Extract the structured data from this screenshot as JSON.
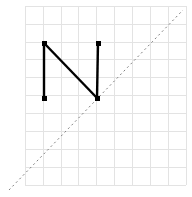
{
  "figure": {
    "width": 192,
    "height": 197,
    "background_color": "#ffffff",
    "title": ""
  },
  "grid": {
    "color": "#e3e3e3",
    "line_width": 1,
    "visible": true,
    "spacing_px": 17.9,
    "x_lines": [
      25.2,
      43.1,
      61.0,
      78.9,
      96.8,
      114.7,
      132.6,
      150.5,
      168.4,
      186.3
    ],
    "y_lines": [
      6.2,
      24.1,
      42.0,
      59.9,
      77.8,
      95.7,
      113.6,
      131.5,
      149.4,
      167.3,
      185.2
    ],
    "x_min": 25.2,
    "x_max": 186.3,
    "y_min": 6.2,
    "y_max": 185.2
  },
  "identity_line": {
    "name": "diagonal-dashed-line",
    "color": "#808080",
    "line_width": 1,
    "dash_pattern": "2,3",
    "x1": 9.0,
    "y1": 190.0,
    "x2": 183.0,
    "y2": 10.0
  },
  "shape": {
    "name": "letter-n-polyline",
    "color": "#000000",
    "line_width": 2.4,
    "marker": "square",
    "marker_size": 5,
    "segments": [
      {
        "name": "left-vertical-stroke",
        "x1": 44.0,
        "y1": 43.0,
        "x2": 44.0,
        "y2": 98.0
      },
      {
        "name": "diagonal-stroke",
        "x1": 44.0,
        "y1": 43.0,
        "x2": 97.0,
        "y2": 98.0
      },
      {
        "name": "right-vertical-stroke",
        "x1": 98.0,
        "y1": 43.0,
        "x2": 97.0,
        "y2": 98.0
      }
    ],
    "vertices": [
      {
        "name": "top-left-vertex",
        "x": 44.0,
        "y": 43.0
      },
      {
        "name": "bottom-left-vertex",
        "x": 44.0,
        "y": 98.0
      },
      {
        "name": "top-right-vertex",
        "x": 98.0,
        "y": 43.0
      },
      {
        "name": "bottom-right-vertex",
        "x": 97.0,
        "y": 98.0
      }
    ]
  },
  "chart_data": {
    "type": "line",
    "title": "",
    "xlabel": "",
    "ylabel": "",
    "grid": true,
    "legend": "none",
    "xlim": [
      25.2,
      186.3
    ],
    "ylim": [
      6.2,
      185.2
    ],
    "series": [
      {
        "name": "letter-n-path",
        "style": "solid",
        "color": "#000000",
        "markers": "square",
        "points": [
          {
            "x": 44.0,
            "y": 98.0
          },
          {
            "x": 44.0,
            "y": 43.0
          },
          {
            "x": 97.0,
            "y": 98.0
          },
          {
            "x": 98.0,
            "y": 43.0
          }
        ]
      },
      {
        "name": "identity-reference",
        "style": "dashed",
        "color": "#808080",
        "markers": "none",
        "points": [
          {
            "x": 9.0,
            "y": 190.0
          },
          {
            "x": 183.0,
            "y": 10.0
          }
        ]
      }
    ]
  }
}
